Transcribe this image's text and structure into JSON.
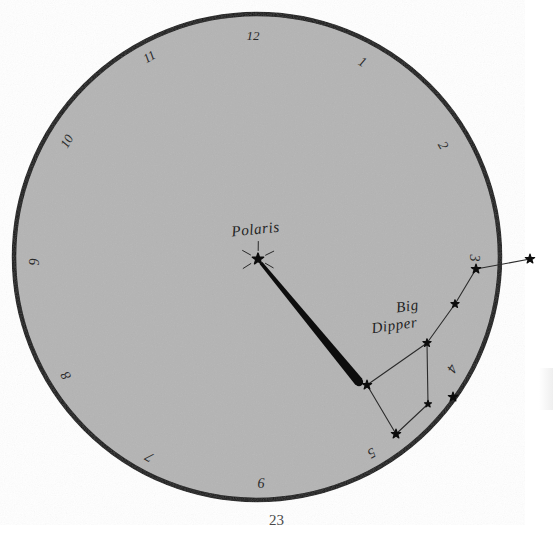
{
  "figure": {
    "caption_page_number": "23",
    "background_color": "#ffffff",
    "dial": {
      "fill_color": "#b4b4b4",
      "stroke_color": "#111111",
      "center_x": 257,
      "center_y": 257,
      "radius": 243,
      "stroke_width": 4.5
    },
    "hour_marks": [
      {
        "label": "12",
        "hour": 12,
        "angle_deg": 0,
        "x": 253,
        "y": 37,
        "rotate": 0
      },
      {
        "label": "1",
        "hour": 1,
        "angle_deg": 30,
        "x": 362,
        "y": 63,
        "rotate": 30
      },
      {
        "label": "2",
        "hour": 2,
        "angle_deg": 60,
        "x": 442,
        "y": 146,
        "rotate": 60
      },
      {
        "label": "3",
        "hour": 3,
        "angle_deg": 90,
        "x": 473,
        "y": 258,
        "rotate": 90
      },
      {
        "label": "4",
        "hour": 4,
        "angle_deg": 120,
        "x": 451,
        "y": 368,
        "rotate": 120
      },
      {
        "label": "5",
        "hour": 5,
        "angle_deg": 150,
        "x": 371,
        "y": 452,
        "rotate": 150
      },
      {
        "label": "6",
        "hour": 6,
        "angle_deg": 180,
        "x": 261,
        "y": 485,
        "rotate": 0
      },
      {
        "label": "7",
        "hour": 7,
        "angle_deg": 210,
        "x": 150,
        "y": 456,
        "rotate": -150
      },
      {
        "label": "8",
        "hour": 8,
        "angle_deg": 240,
        "x": 67,
        "y": 375,
        "rotate": -120
      },
      {
        "label": "9",
        "hour": 9,
        "angle_deg": 270,
        "x": 36,
        "y": 262,
        "rotate": -90
      },
      {
        "label": "10",
        "hour": 10,
        "angle_deg": 300,
        "x": 68,
        "y": 142,
        "rotate": -60
      },
      {
        "label": "11",
        "hour": 11,
        "angle_deg": 330,
        "x": 150,
        "y": 58,
        "rotate": -30
      }
    ],
    "labels": {
      "polaris": {
        "text": "Polaris",
        "x": 256,
        "y": 234,
        "rotate": -6
      },
      "big_dipper_line1": {
        "text": "Big",
        "x": 408,
        "y": 311,
        "rotate": -8
      },
      "big_dipper_line2": {
        "text": "Dipper",
        "x": 395,
        "y": 330,
        "rotate": -8
      }
    },
    "polaris_star": {
      "x": 258,
      "y": 259,
      "size": 9,
      "rays": true
    },
    "pointer_line": {
      "from_x": 261,
      "from_y": 263,
      "to_x": 359,
      "to_y": 382,
      "width_start": 3.5,
      "width_end": 9,
      "color": "#0d0d0d",
      "description": "pointer from Dubhe to Polaris"
    },
    "dipper_stars": [
      {
        "name": "dubhe",
        "x": 367,
        "y": 385,
        "size": 8
      },
      {
        "name": "merak",
        "x": 396,
        "y": 434,
        "size": 8
      },
      {
        "name": "phecda",
        "x": 428,
        "y": 404,
        "size": 6
      },
      {
        "name": "megrez",
        "x": 427,
        "y": 343,
        "size": 7
      },
      {
        "name": "alioth",
        "x": 455,
        "y": 304,
        "size": 7
      },
      {
        "name": "mizar",
        "x": 476,
        "y": 269,
        "size": 8
      },
      {
        "name": "alkaid",
        "x": 530,
        "y": 259,
        "size": 8
      },
      {
        "name": "extra-a",
        "x": 453,
        "y": 397,
        "size": 8
      }
    ],
    "dipper_links": [
      {
        "from": "dubhe",
        "to": "merak"
      },
      {
        "from": "merak",
        "to": "phecda"
      },
      {
        "from": "phecda",
        "to": "megrez"
      },
      {
        "from": "megrez",
        "to": "dubhe"
      },
      {
        "from": "megrez",
        "to": "alioth"
      },
      {
        "from": "alioth",
        "to": "mizar"
      },
      {
        "from": "mizar",
        "to": "alkaid"
      }
    ],
    "link_color": "#2b2b2b",
    "link_width": 1.1,
    "star_color": "#0d0d0d"
  }
}
